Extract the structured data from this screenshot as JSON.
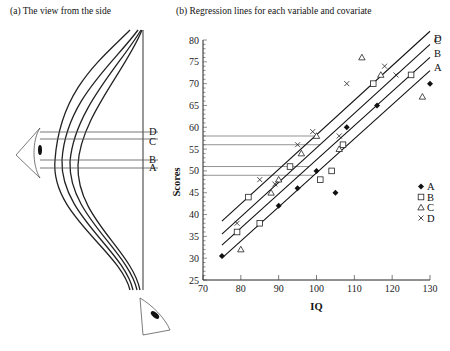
{
  "panel_a": {
    "caption": "(a) The view from the side",
    "labels": [
      "D",
      "C",
      "B",
      "A"
    ]
  },
  "panel_b": {
    "caption": "(b) Regression lines for each variable and covariate"
  },
  "chart_data": [
    {
      "type": "diagram",
      "title": "(a) The view from the side",
      "description": "Side-on view of four parallel regression lines, with eye icons showing the viewing direction; horizontal reference lines connect to labels D, C, B, A",
      "labels": [
        "D",
        "C",
        "B",
        "A"
      ]
    },
    {
      "type": "scatter",
      "title": "(b) Regression lines for each variable and covariate",
      "xlabel": "IQ",
      "ylabel": "Scores",
      "xlim": [
        70,
        130
      ],
      "ylim": [
        25,
        80
      ],
      "xticks": [
        70,
        80,
        90,
        100,
        110,
        120,
        130
      ],
      "yticks": [
        25,
        30,
        35,
        40,
        45,
        50,
        55,
        60,
        65,
        70,
        75,
        80
      ],
      "legend": [
        "A",
        "B",
        "C",
        "D"
      ],
      "legend_position": "lower right",
      "reference_lines_at_intercept": {
        "D": 58,
        "C": 56,
        "B": 51,
        "A": 49
      },
      "series": [
        {
          "name": "A",
          "marker": "filled-diamond",
          "points": [
            [
              75,
              30.5
            ],
            [
              90,
              42
            ],
            [
              95,
              46
            ],
            [
              100,
              50
            ],
            [
              105,
              45
            ],
            [
              108,
              60
            ],
            [
              116,
              65
            ],
            [
              130,
              70
            ]
          ],
          "fit": {
            "x": [
              75,
              130
            ],
            "y": [
              30,
              73
            ]
          }
        },
        {
          "name": "B",
          "marker": "open-square",
          "points": [
            [
              79,
              36
            ],
            [
              82,
              44
            ],
            [
              85,
              38
            ],
            [
              93,
              51
            ],
            [
              101,
              48
            ],
            [
              104,
              50
            ],
            [
              107,
              56
            ],
            [
              115,
              70
            ],
            [
              125,
              72
            ]
          ],
          "fit": {
            "x": [
              75,
              130
            ],
            "y": [
              33,
              76
            ]
          }
        },
        {
          "name": "C",
          "marker": "open-triangle",
          "points": [
            [
              80,
              32
            ],
            [
              88,
              45
            ],
            [
              90,
              48
            ],
            [
              96,
              54
            ],
            [
              100,
              58
            ],
            [
              106,
              55
            ],
            [
              112,
              76
            ],
            [
              117,
              72
            ],
            [
              128,
              67
            ]
          ],
          "fit": {
            "x": [
              75,
              130
            ],
            "y": [
              35.5,
              79
            ]
          }
        },
        {
          "name": "D",
          "marker": "x-cross",
          "points": [
            [
              79,
              38
            ],
            [
              85,
              48
            ],
            [
              89,
              47
            ],
            [
              95,
              56
            ],
            [
              99,
              59
            ],
            [
              106,
              58
            ],
            [
              108,
              70
            ],
            [
              118,
              74
            ],
            [
              121,
              72
            ]
          ],
          "fit": {
            "x": [
              75,
              130
            ],
            "y": [
              38.5,
              82
            ]
          }
        }
      ]
    }
  ]
}
